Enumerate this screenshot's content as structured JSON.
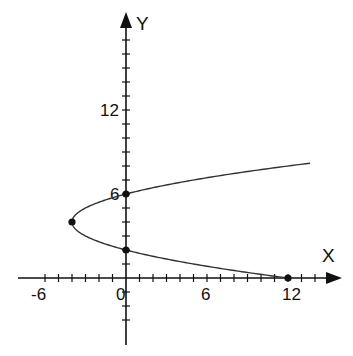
{
  "chart_data": {
    "type": "line",
    "title": "",
    "xlabel": "X",
    "ylabel": "Y",
    "equation": "x = (y - 2)(y - 6)",
    "xlim": [
      -8,
      15
    ],
    "ylim": [
      -5,
      19
    ],
    "x_tick_labels": [
      {
        "value": -6,
        "label": "-6"
      },
      {
        "value": 0,
        "label": "0"
      },
      {
        "value": 6,
        "label": "6"
      },
      {
        "value": 12,
        "label": "12"
      }
    ],
    "y_tick_labels": [
      {
        "value": 6,
        "label": "6"
      },
      {
        "value": 12,
        "label": "12"
      }
    ],
    "x_ticks": {
      "from": -6,
      "to": 14,
      "step": 1
    },
    "y_ticks": {
      "from": -3,
      "to": 17,
      "step": 1
    },
    "grid": false,
    "series": [
      {
        "name": "parabola",
        "y_range": [
          0,
          8.2
        ],
        "color": "#333333"
      }
    ],
    "points": [
      {
        "x": -4,
        "y": 4,
        "label": "vertex"
      },
      {
        "x": 0,
        "y": 6,
        "label": "y-intercept"
      },
      {
        "x": 0,
        "y": 2,
        "label": "y-intercept"
      },
      {
        "x": 12,
        "y": 0,
        "label": "x-intercept"
      }
    ]
  },
  "style": {
    "axis_color": "#111111",
    "curve_color": "#333333",
    "point_color": "#111111"
  }
}
